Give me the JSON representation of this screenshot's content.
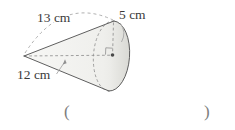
{
  "diagram": {
    "type": "cone-oblique-view",
    "labels": {
      "slant": "13 cm",
      "radius": "5 cm",
      "height": "12 cm"
    },
    "answer_blank": {
      "open": "(",
      "close": ")"
    },
    "colors": {
      "outline": "#5f5f5f",
      "dashed": "#8a8a8a",
      "leader": "#a8a8a8",
      "fill_light": "#f6f6f4",
      "fill_dark": "#deded9",
      "label_text": "#3a3a3a",
      "paren_text": "#7d7d7d",
      "dot": "#4a4a4a",
      "background": "#ffffff"
    }
  }
}
